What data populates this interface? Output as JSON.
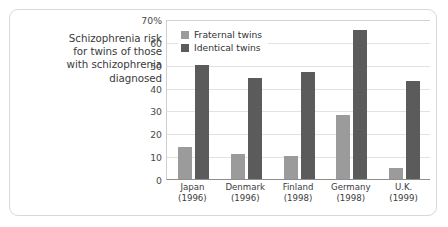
{
  "caption": {
    "lines": [
      "Schizophrenia risk",
      "for twins of those",
      "with schizophrenia",
      "diagnosed"
    ]
  },
  "legend": {
    "position": "top-left-inside",
    "items": [
      {
        "label": "Fraternal twins",
        "color": "#9b9b9b",
        "icon": "square-swatch-icon"
      },
      {
        "label": "Identical twins",
        "color": "#5b5b5b",
        "icon": "square-swatch-icon"
      }
    ]
  },
  "chart_data": {
    "type": "bar",
    "title": "Schizophrenia risk for twins of those with schizophrenia diagnosed",
    "xlabel": "",
    "ylabel": "",
    "ylim": [
      0,
      70
    ],
    "grid": true,
    "legend_position": "top-left-inside",
    "categories": [
      "Japan",
      "Denmark",
      "Finland",
      "Germany",
      "U.K."
    ],
    "category_years": [
      "(1996)",
      "(1996)",
      "(1998)",
      "(1998)",
      "(1999)"
    ],
    "ticks": [
      "70%",
      "60",
      "50",
      "40",
      "30",
      "20",
      "10",
      "0"
    ],
    "tick_values": [
      70,
      60,
      50,
      40,
      30,
      20,
      10,
      0
    ],
    "series": [
      {
        "name": "Fraternal twins",
        "color": "#9b9b9b",
        "values": [
          14,
          11,
          10,
          28,
          5
        ]
      },
      {
        "name": "Identical twins",
        "color": "#5b5b5b",
        "values": [
          50,
          44,
          47,
          65,
          43
        ]
      }
    ]
  }
}
